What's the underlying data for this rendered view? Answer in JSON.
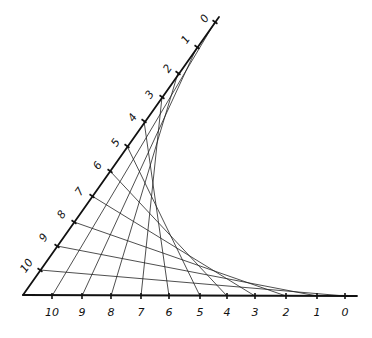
{
  "diagram": {
    "type": "string-art-envelope",
    "vertex": [
      23,
      295
    ],
    "slanted_axis": {
      "end": [
        219,
        17
      ],
      "labels": [
        "0",
        "1",
        "2",
        "3",
        "4",
        "5",
        "6",
        "7",
        "8",
        "9",
        "10"
      ],
      "ticks": [
        [
          215,
          22
        ],
        [
          197,
          47
        ],
        [
          178,
          73
        ],
        [
          162,
          97
        ],
        [
          144,
          121
        ],
        [
          127,
          146
        ],
        [
          110,
          171
        ],
        [
          92,
          196
        ],
        [
          74,
          222
        ],
        [
          57,
          246
        ],
        [
          40,
          270
        ]
      ],
      "label_pos": [
        [
          205,
          19
        ],
        [
          186,
          40
        ],
        [
          168,
          69
        ],
        [
          150,
          95
        ],
        [
          133,
          118
        ],
        [
          116,
          143
        ],
        [
          98,
          166
        ],
        [
          80,
          192
        ],
        [
          62,
          215
        ],
        [
          44,
          238
        ],
        [
          27,
          266
        ]
      ]
    },
    "bottom_axis": {
      "end": [
        357,
        296
      ],
      "y": 296,
      "labels": [
        "0",
        "1",
        "2",
        "3",
        "4",
        "5",
        "6",
        "7",
        "8",
        "9",
        "10"
      ],
      "ticks_x": [
        345,
        317,
        286,
        255,
        227,
        200,
        169,
        141,
        111,
        82,
        52
      ],
      "label_y": 316
    },
    "pairing_rule": "slanted k connects to bottom (10 - k)"
  }
}
